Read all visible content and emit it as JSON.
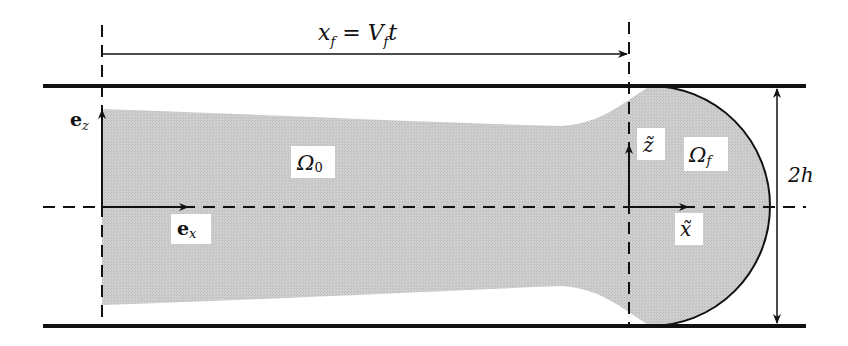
{
  "figure": {
    "colors": {
      "fluid_fill": "#c8c8c8",
      "line": "#111111",
      "background": "#ffffff"
    },
    "labels": {
      "front_position": {
        "lhs": "x",
        "lhs_sub": "f",
        "eq": " = ",
        "rhs": "V",
        "rhs_sub": "f",
        "rhs_tail": "t"
      },
      "omega_0": {
        "main": "Ω",
        "sub": "0"
      },
      "omega_f": {
        "main": "Ω",
        "sub": "f"
      },
      "e_z": {
        "main": "e",
        "sub": "z"
      },
      "e_x": {
        "main": "e",
        "sub": "x"
      },
      "z_tilde": "z̃",
      "x_tilde": "x̃",
      "gap": "2h"
    }
  }
}
